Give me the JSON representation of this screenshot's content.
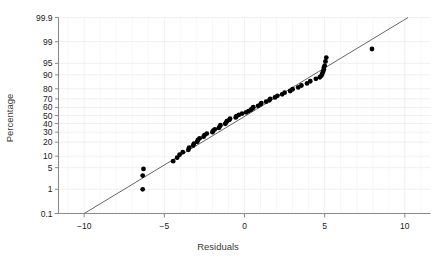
{
  "chart_data": {
    "type": "scatter",
    "title": "",
    "xlabel": "Residuals",
    "ylabel": "Percentage",
    "xlim": [
      -11.6,
      11.6
    ],
    "ylim_percent": [
      0.1,
      99.9
    ],
    "grid": true,
    "legend": null,
    "xticks": [
      -10,
      -5,
      0,
      5,
      10
    ],
    "xtick_labels": [
      "−10",
      "−5",
      "0",
      "5",
      "10"
    ],
    "yticks": [
      99.9,
      99,
      95,
      90,
      80,
      70,
      60,
      50,
      40,
      30,
      20,
      10,
      5,
      1,
      0.1
    ],
    "ytick_labels": [
      "99.9",
      "99",
      "95",
      "90",
      "80",
      "70",
      "60",
      "50",
      "40",
      "30",
      "20",
      "10",
      "5",
      "1",
      "0.1"
    ],
    "reference_line": {
      "x": [
        -10.0,
        10.2
      ],
      "percent": [
        0.1,
        99.9
      ],
      "color": "#555555"
    },
    "point_color": "#000000",
    "point_radius": 2.4,
    "points": [
      {
        "x": -6.35,
        "percent": 1.0
      },
      {
        "x": -6.35,
        "percent": 2.9
      },
      {
        "x": -6.3,
        "percent": 4.6
      },
      {
        "x": -4.45,
        "percent": 7.5
      },
      {
        "x": -4.2,
        "percent": 9.2
      },
      {
        "x": -4.05,
        "percent": 10.8
      },
      {
        "x": -3.85,
        "percent": 12.4
      },
      {
        "x": -3.5,
        "percent": 14.0
      },
      {
        "x": -3.45,
        "percent": 15.6
      },
      {
        "x": -3.2,
        "percent": 17.2
      },
      {
        "x": -3.15,
        "percent": 18.8
      },
      {
        "x": -2.95,
        "percent": 20.4
      },
      {
        "x": -2.9,
        "percent": 22.0
      },
      {
        "x": -2.8,
        "percent": 23.6
      },
      {
        "x": -2.55,
        "percent": 25.2
      },
      {
        "x": -2.5,
        "percent": 26.8
      },
      {
        "x": -2.35,
        "percent": 28.4
      },
      {
        "x": -2.0,
        "percent": 30.0
      },
      {
        "x": -1.95,
        "percent": 31.6
      },
      {
        "x": -1.85,
        "percent": 33.2
      },
      {
        "x": -1.6,
        "percent": 34.8
      },
      {
        "x": -1.55,
        "percent": 36.4
      },
      {
        "x": -1.5,
        "percent": 38.0
      },
      {
        "x": -1.2,
        "percent": 39.6
      },
      {
        "x": -1.15,
        "percent": 41.2
      },
      {
        "x": -1.1,
        "percent": 42.8
      },
      {
        "x": -0.95,
        "percent": 44.4
      },
      {
        "x": -0.9,
        "percent": 46.0
      },
      {
        "x": -0.55,
        "percent": 47.6
      },
      {
        "x": -0.5,
        "percent": 49.2
      },
      {
        "x": -0.35,
        "percent": 50.8
      },
      {
        "x": -0.15,
        "percent": 52.4
      },
      {
        "x": 0.1,
        "percent": 54.0
      },
      {
        "x": 0.25,
        "percent": 55.6
      },
      {
        "x": 0.4,
        "percent": 57.2
      },
      {
        "x": 0.5,
        "percent": 58.8
      },
      {
        "x": 0.55,
        "percent": 60.4
      },
      {
        "x": 0.85,
        "percent": 62.0
      },
      {
        "x": 1.0,
        "percent": 63.6
      },
      {
        "x": 1.05,
        "percent": 65.2
      },
      {
        "x": 1.35,
        "percent": 66.8
      },
      {
        "x": 1.55,
        "percent": 68.4
      },
      {
        "x": 1.6,
        "percent": 70.0
      },
      {
        "x": 1.9,
        "percent": 71.6
      },
      {
        "x": 2.05,
        "percent": 73.2
      },
      {
        "x": 2.35,
        "percent": 74.8
      },
      {
        "x": 2.5,
        "percent": 76.4
      },
      {
        "x": 2.85,
        "percent": 78.0
      },
      {
        "x": 3.0,
        "percent": 79.6
      },
      {
        "x": 3.35,
        "percent": 81.2
      },
      {
        "x": 3.55,
        "percent": 82.8
      },
      {
        "x": 3.9,
        "percent": 84.4
      },
      {
        "x": 4.1,
        "percent": 86.0
      },
      {
        "x": 4.45,
        "percent": 87.6
      },
      {
        "x": 4.7,
        "percent": 88.6
      },
      {
        "x": 4.8,
        "percent": 89.6
      },
      {
        "x": 4.85,
        "percent": 90.6
      },
      {
        "x": 4.9,
        "percent": 91.6
      },
      {
        "x": 4.95,
        "percent": 92.6
      },
      {
        "x": 4.95,
        "percent": 93.4
      },
      {
        "x": 5.0,
        "percent": 94.2
      },
      {
        "x": 5.05,
        "percent": 95.6
      },
      {
        "x": 5.1,
        "percent": 96.6
      },
      {
        "x": 7.95,
        "percent": 98.2
      }
    ]
  }
}
